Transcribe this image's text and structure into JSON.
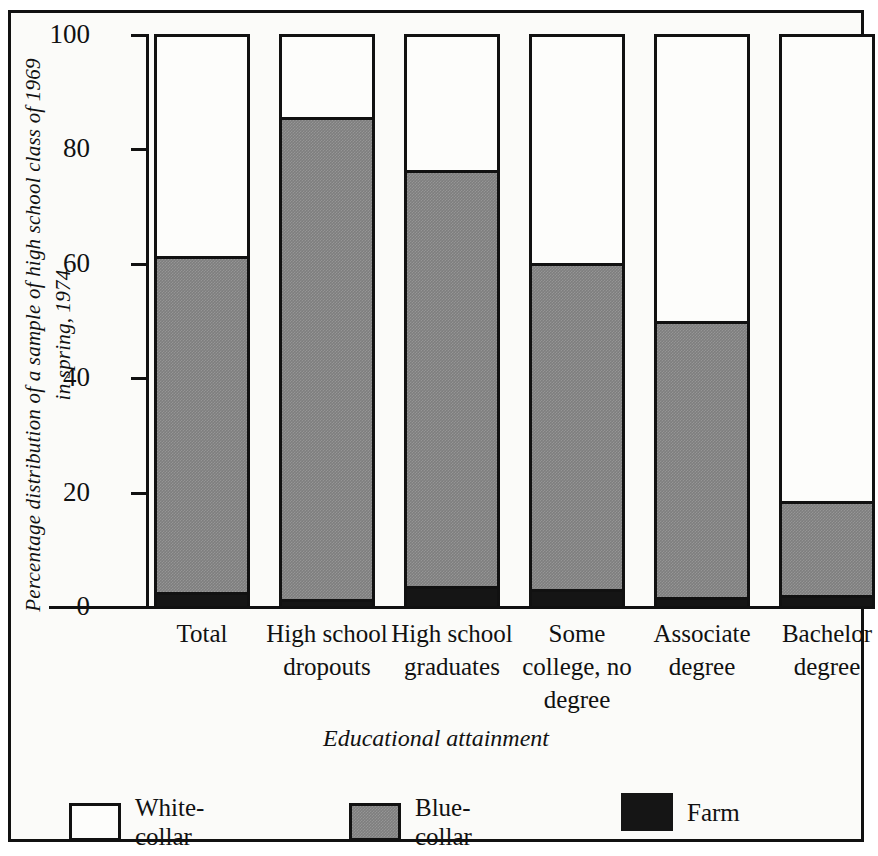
{
  "chart_data": {
    "type": "bar",
    "subtype": "stacked-100-percent",
    "title": "",
    "xlabel": "Educational attainment",
    "ylabel": "Percentage distribution of a sample of\nhigh school class of 1969 in spring, 1974",
    "ylim": [
      0,
      100
    ],
    "yticks": [
      0,
      20,
      40,
      60,
      80,
      100
    ],
    "ytick_labels": [
      "0",
      "20",
      "40",
      "60",
      "80",
      "100"
    ],
    "grid": false,
    "legend_position": "bottom",
    "categories": [
      "Total",
      "High\nschool\ndropouts",
      "High\nschool\ngraduates",
      "Some\ncollege,\nno degree",
      "Associate\ndegree",
      "Bachelor\ndegree"
    ],
    "series": [
      {
        "name": "White-collar",
        "legend_label": "White-\ncollar",
        "color": "#fdfdfb",
        "values": [
          39.2,
          15.0,
          24.2,
          40.4,
          50.4,
          81.8
        ]
      },
      {
        "name": "Blue-collar",
        "legend_label": "Blue-\ncollar",
        "color": "#7e7e7e",
        "values": [
          58.3,
          83.8,
          72.4,
          56.6,
          48.1,
          16.2
        ]
      },
      {
        "name": "Farm",
        "legend_label": "Farm",
        "color": "#151515",
        "values": [
          2.5,
          1.2,
          3.4,
          3.0,
          1.5,
          2.0
        ]
      }
    ],
    "stack_tops": {
      "white_collar_top": [
        100,
        100,
        100,
        100,
        100,
        100
      ],
      "blue_collar_top": [
        60.8,
        85.0,
        75.8,
        59.6,
        49.6,
        18.2
      ],
      "farm_top": [
        2.5,
        1.2,
        3.4,
        3.0,
        1.5,
        2.0
      ]
    }
  },
  "figure": {
    "frame_color": "#111111",
    "background": "#fbfbf9"
  }
}
